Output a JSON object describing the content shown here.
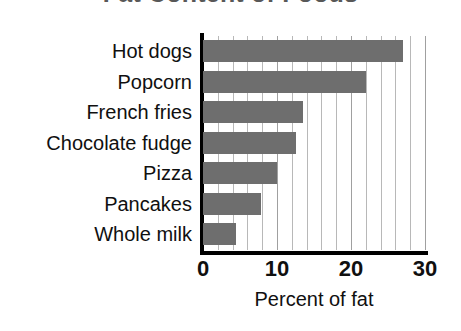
{
  "chart_data": {
    "type": "bar",
    "orientation": "horizontal",
    "title": "Fat Content of Foods",
    "xlabel": "Percent of fat",
    "ylabel": "",
    "categories": [
      "Hot dogs",
      "Popcorn",
      "French fries",
      "Chocolate fudge",
      "Pizza",
      "Pancakes",
      "Whole milk"
    ],
    "values": [
      27,
      22,
      13.5,
      12.5,
      10,
      7.8,
      4.5
    ],
    "xlim": [
      0,
      30
    ],
    "xticks": [
      0,
      10,
      20,
      30
    ],
    "xtick_labels": [
      "0",
      "10",
      "20",
      "30"
    ],
    "gridline_interval": 2,
    "grid": true,
    "legend": null,
    "bar_color": "#6e6e6e",
    "axis_color": "#000000",
    "gridline_color": "#b8b8b8",
    "title_color": "#585858",
    "text_color": "#101010"
  }
}
